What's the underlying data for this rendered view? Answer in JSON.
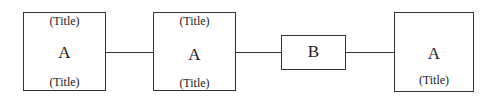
{
  "diagram": {
    "nodes": [
      {
        "id": "node-1",
        "letter": "A",
        "top_title": "(Title)",
        "bottom_title": "(Title)"
      },
      {
        "id": "node-2",
        "letter": "A",
        "top_title": "(Title)",
        "bottom_title": "(Title)"
      },
      {
        "id": "node-3",
        "letter": "B"
      },
      {
        "id": "node-4",
        "letter": "A",
        "bottom_title": "(Title)"
      }
    ],
    "edges": [
      {
        "from": "node-1",
        "to": "node-2"
      },
      {
        "from": "node-2",
        "to": "node-3"
      },
      {
        "from": "node-3",
        "to": "node-4"
      }
    ]
  }
}
